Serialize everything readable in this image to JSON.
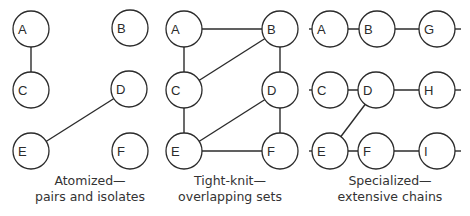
{
  "node_radius": 18,
  "panels": [
    {
      "id": "atomized",
      "caption_line1": "Atomized—",
      "caption_line2": "pairs and isolates",
      "caption_x": 90,
      "nodes": [
        {
          "label": "A",
          "x": 31,
          "y": 29
        },
        {
          "label": "B",
          "x": 130,
          "y": 28
        },
        {
          "label": "C",
          "x": 31,
          "y": 90
        },
        {
          "label": "D",
          "x": 129,
          "y": 89
        },
        {
          "label": "E",
          "x": 31,
          "y": 151
        },
        {
          "label": "F",
          "x": 130,
          "y": 151
        }
      ],
      "edges": [
        [
          "A",
          "C"
        ],
        [
          "D",
          "E"
        ]
      ],
      "stubs": []
    },
    {
      "id": "tight-knit",
      "caption_line1": "Tight-knit—",
      "caption_line2": "overlapping sets",
      "caption_x": 230,
      "nodes": [
        {
          "label": "A",
          "x": 184,
          "y": 29
        },
        {
          "label": "B",
          "x": 280,
          "y": 29
        },
        {
          "label": "C",
          "x": 184,
          "y": 90
        },
        {
          "label": "D",
          "x": 280,
          "y": 90
        },
        {
          "label": "E",
          "x": 184,
          "y": 151
        },
        {
          "label": "F",
          "x": 280,
          "y": 151
        }
      ],
      "edges": [
        [
          "A",
          "B"
        ],
        [
          "A",
          "C"
        ],
        [
          "C",
          "B"
        ],
        [
          "B",
          "D"
        ],
        [
          "C",
          "E"
        ],
        [
          "E",
          "D"
        ],
        [
          "D",
          "F"
        ],
        [
          "E",
          "F"
        ]
      ],
      "stubs": []
    },
    {
      "id": "specialized",
      "caption_line1": "Specialized—",
      "caption_line2": "extensive chains",
      "caption_x": 390,
      "nodes": [
        {
          "label": "A",
          "x": 330,
          "y": 29
        },
        {
          "label": "B",
          "x": 377,
          "y": 29
        },
        {
          "label": "G",
          "x": 437,
          "y": 29
        },
        {
          "label": "C",
          "x": 330,
          "y": 90
        },
        {
          "label": "D",
          "x": 376,
          "y": 90
        },
        {
          "label": "H",
          "x": 437,
          "y": 90
        },
        {
          "label": "E",
          "x": 330,
          "y": 151
        },
        {
          "label": "F",
          "x": 376,
          "y": 151
        },
        {
          "label": "I",
          "x": 437,
          "y": 151
        }
      ],
      "edges": [
        [
          "A",
          "B"
        ],
        [
          "B",
          "G"
        ],
        [
          "C",
          "D"
        ],
        [
          "D",
          "H"
        ],
        [
          "E",
          "F"
        ],
        [
          "F",
          "I"
        ],
        [
          "D",
          "E"
        ]
      ],
      "stubs": [
        {
          "x1": 309,
          "y1": 29,
          "x2": 312,
          "y2": 29
        },
        {
          "x1": 455,
          "y1": 29,
          "x2": 461,
          "y2": 29
        },
        {
          "x1": 309,
          "y1": 90,
          "x2": 312,
          "y2": 90
        },
        {
          "x1": 455,
          "y1": 90,
          "x2": 461,
          "y2": 90
        },
        {
          "x1": 309,
          "y1": 151,
          "x2": 312,
          "y2": 151
        },
        {
          "x1": 455,
          "y1": 151,
          "x2": 461,
          "y2": 151
        }
      ]
    }
  ]
}
